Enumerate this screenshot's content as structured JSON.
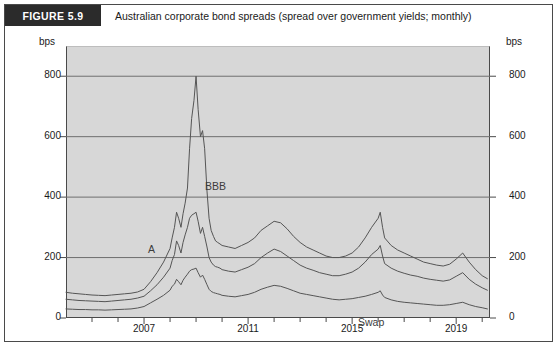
{
  "figure": {
    "badge": "FIGURE 5.9",
    "title": "Australian corporate bond spreads (spread over government yields; monthly)"
  },
  "chart_data": {
    "type": "line",
    "title": "Australian corporate bond spreads (spread over government yields; monthly)",
    "xlabel": "",
    "ylabel": "bps",
    "y_unit_left": "bps",
    "y_unit_right": "bps",
    "ylim": [
      0,
      900
    ],
    "yticks": [
      0,
      200,
      400,
      600,
      800
    ],
    "ytick_labels": [
      "0",
      "200",
      "400",
      "600",
      "800"
    ],
    "xlim": [
      2004.0,
      2020.3
    ],
    "xticks": [
      2005,
      2006,
      2007,
      2008,
      2009,
      2010,
      2011,
      2012,
      2013,
      2014,
      2015,
      2016,
      2017,
      2018,
      2019,
      2020
    ],
    "xtick_labels_shown": [
      "2007",
      "2011",
      "2015",
      "2019"
    ],
    "xtick_labels_shown_values": [
      2007,
      2011,
      2015,
      2019
    ],
    "grid": "horizontal",
    "legend_position": "inline-annotations",
    "plot_background": "#d7d7d7",
    "line_color": "#555555",
    "annotations": [
      {
        "text": "BBB",
        "x": 2009.9,
        "y": 600
      },
      {
        "text": "A",
        "x": 2007.6,
        "y": 375
      },
      {
        "text": "Swap",
        "x": 2016.2,
        "y": 95
      }
    ],
    "series": [
      {
        "name": "BBB",
        "color": "#555555",
        "x": [
          2004.0,
          2004.25,
          2004.5,
          2004.75,
          2005.0,
          2005.25,
          2005.5,
          2005.75,
          2006.0,
          2006.25,
          2006.5,
          2006.75,
          2007.0,
          2007.25,
          2007.5,
          2007.75,
          2008.0,
          2008.08,
          2008.17,
          2008.25,
          2008.33,
          2008.42,
          2008.5,
          2008.58,
          2008.67,
          2008.75,
          2008.83,
          2008.92,
          2009.0,
          2009.08,
          2009.17,
          2009.25,
          2009.33,
          2009.42,
          2009.5,
          2009.58,
          2009.67,
          2009.75,
          2009.83,
          2009.92,
          2010.0,
          2010.25,
          2010.5,
          2010.75,
          2011.0,
          2011.25,
          2011.5,
          2011.75,
          2012.0,
          2012.25,
          2012.5,
          2012.75,
          2013.0,
          2013.25,
          2013.5,
          2013.75,
          2014.0,
          2014.25,
          2014.5,
          2014.75,
          2015.0,
          2015.25,
          2015.5,
          2015.75,
          2016.0,
          2016.08,
          2016.17,
          2016.25,
          2016.5,
          2016.75,
          2017.0,
          2017.25,
          2017.5,
          2017.75,
          2018.0,
          2018.25,
          2018.5,
          2018.75,
          2019.0,
          2019.25,
          2019.5,
          2019.75,
          2020.0,
          2020.2
        ],
        "y": [
          85,
          82,
          80,
          78,
          76,
          75,
          74,
          76,
          78,
          80,
          82,
          86,
          95,
          120,
          150,
          185,
          230,
          265,
          300,
          350,
          330,
          300,
          345,
          380,
          430,
          560,
          660,
          720,
          800,
          690,
          600,
          620,
          560,
          420,
          330,
          290,
          270,
          255,
          250,
          245,
          240,
          235,
          230,
          240,
          250,
          265,
          290,
          305,
          320,
          315,
          295,
          270,
          250,
          235,
          225,
          215,
          205,
          200,
          200,
          205,
          215,
          235,
          265,
          300,
          330,
          350,
          300,
          265,
          240,
          225,
          215,
          205,
          195,
          185,
          180,
          175,
          172,
          178,
          195,
          215,
          185,
          160,
          140,
          130
        ]
      },
      {
        "name": "A",
        "color": "#555555",
        "x": [
          2004.0,
          2004.25,
          2004.5,
          2004.75,
          2005.0,
          2005.25,
          2005.5,
          2005.75,
          2006.0,
          2006.25,
          2006.5,
          2006.75,
          2007.0,
          2007.25,
          2007.5,
          2007.75,
          2008.0,
          2008.08,
          2008.17,
          2008.25,
          2008.33,
          2008.42,
          2008.5,
          2008.58,
          2008.67,
          2008.75,
          2008.83,
          2008.92,
          2009.0,
          2009.08,
          2009.17,
          2009.25,
          2009.33,
          2009.42,
          2009.5,
          2009.58,
          2009.67,
          2009.75,
          2009.83,
          2009.92,
          2010.0,
          2010.25,
          2010.5,
          2010.75,
          2011.0,
          2011.25,
          2011.5,
          2011.75,
          2012.0,
          2012.25,
          2012.5,
          2012.75,
          2013.0,
          2013.25,
          2013.5,
          2013.75,
          2014.0,
          2014.25,
          2014.5,
          2014.75,
          2015.0,
          2015.25,
          2015.5,
          2015.75,
          2016.0,
          2016.08,
          2016.17,
          2016.25,
          2016.5,
          2016.75,
          2017.0,
          2017.25,
          2017.5,
          2017.75,
          2018.0,
          2018.25,
          2018.5,
          2018.75,
          2019.0,
          2019.25,
          2019.5,
          2019.75,
          2020.0,
          2020.2
        ],
        "y": [
          62,
          60,
          58,
          57,
          56,
          55,
          54,
          56,
          58,
          60,
          62,
          66,
          72,
          90,
          110,
          135,
          165,
          190,
          210,
          255,
          240,
          215,
          250,
          275,
          300,
          330,
          340,
          345,
          350,
          320,
          280,
          300,
          270,
          235,
          200,
          185,
          175,
          170,
          168,
          165,
          160,
          155,
          152,
          160,
          168,
          180,
          200,
          215,
          228,
          220,
          205,
          190,
          175,
          165,
          158,
          150,
          145,
          140,
          140,
          145,
          152,
          165,
          185,
          210,
          228,
          240,
          205,
          180,
          165,
          155,
          148,
          142,
          138,
          132,
          128,
          125,
          122,
          126,
          138,
          150,
          128,
          112,
          100,
          92
        ]
      },
      {
        "name": "Swap",
        "color": "#555555",
        "x": [
          2004.0,
          2004.25,
          2004.5,
          2004.75,
          2005.0,
          2005.25,
          2005.5,
          2005.75,
          2006.0,
          2006.25,
          2006.5,
          2006.75,
          2007.0,
          2007.25,
          2007.5,
          2007.75,
          2008.0,
          2008.08,
          2008.17,
          2008.25,
          2008.33,
          2008.42,
          2008.5,
          2008.58,
          2008.67,
          2008.75,
          2008.83,
          2008.92,
          2009.0,
          2009.08,
          2009.17,
          2009.25,
          2009.33,
          2009.42,
          2009.5,
          2009.58,
          2009.67,
          2009.75,
          2009.83,
          2009.92,
          2010.0,
          2010.25,
          2010.5,
          2010.75,
          2011.0,
          2011.25,
          2011.5,
          2011.75,
          2012.0,
          2012.25,
          2012.5,
          2012.75,
          2013.0,
          2013.25,
          2013.5,
          2013.75,
          2014.0,
          2014.25,
          2014.5,
          2014.75,
          2015.0,
          2015.25,
          2015.5,
          2015.75,
          2016.0,
          2016.08,
          2016.17,
          2016.25,
          2016.5,
          2016.75,
          2017.0,
          2017.25,
          2017.5,
          2017.75,
          2018.0,
          2018.25,
          2018.5,
          2018.75,
          2019.0,
          2019.25,
          2019.5,
          2019.75,
          2020.0,
          2020.2
        ],
        "y": [
          30,
          29,
          28,
          28,
          27,
          27,
          26,
          27,
          28,
          29,
          30,
          33,
          38,
          50,
          62,
          75,
          92,
          105,
          112,
          128,
          120,
          110,
          125,
          135,
          145,
          155,
          160,
          162,
          165,
          150,
          135,
          142,
          128,
          110,
          95,
          88,
          84,
          82,
          80,
          78,
          75,
          72,
          70,
          74,
          78,
          85,
          95,
          102,
          108,
          105,
          98,
          90,
          82,
          78,
          74,
          70,
          66,
          62,
          60,
          62,
          64,
          68,
          72,
          78,
          85,
          90,
          76,
          68,
          60,
          55,
          52,
          50,
          48,
          46,
          44,
          42,
          42,
          44,
          48,
          52,
          44,
          38,
          34,
          30
        ]
      }
    ]
  }
}
